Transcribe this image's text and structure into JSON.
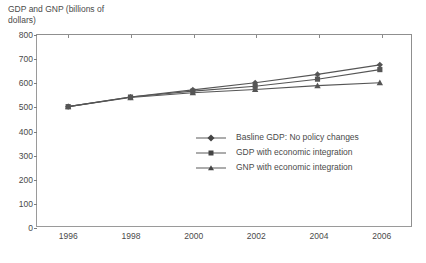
{
  "chart_data": {
    "type": "line",
    "title": "GDP and GNP (billions of dollars)",
    "title_line1": "GDP and GNP (billions of",
    "title_line2": "dollars)",
    "xlabel": "",
    "ylabel": "GDP and GNP (billions of dollars)",
    "x": [
      1996,
      1998,
      2000,
      2002,
      2004,
      2006
    ],
    "xtick_labels": [
      "1996",
      "1998",
      "2000",
      "2002",
      "2004",
      "2006"
    ],
    "ytick_labels": [
      "0",
      "100",
      "200",
      "300",
      "400",
      "500",
      "600",
      "700",
      "800"
    ],
    "ytick_values": [
      0,
      100,
      200,
      300,
      400,
      500,
      600,
      700,
      800
    ],
    "ylim": [
      0,
      800
    ],
    "xlim": [
      1995,
      2007
    ],
    "grid": false,
    "legend_position": "center-right-inside",
    "series": [
      {
        "name": "Basline GDP: No policy changes",
        "marker": "diamond",
        "color": "#555555",
        "values": [
          500,
          540,
          570,
          600,
          635,
          675
        ]
      },
      {
        "name": "GDP with economic integration",
        "marker": "square",
        "color": "#555555",
        "values": [
          500,
          540,
          565,
          585,
          615,
          655
        ]
      },
      {
        "name": "GNP with economic integration",
        "marker": "triangle",
        "color": "#555555",
        "values": [
          500,
          538,
          558,
          572,
          588,
          600
        ]
      }
    ]
  },
  "colors": {
    "line": "#555555",
    "axis": "#8f8f8f",
    "text": "#4a4a4a",
    "background": "#ffffff"
  }
}
